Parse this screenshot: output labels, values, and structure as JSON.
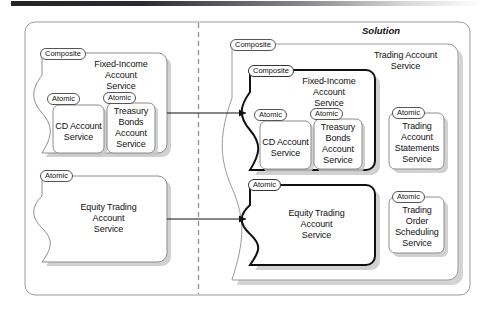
{
  "diagram": {
    "type": "soa-service-composition",
    "top_bar": "header-rule",
    "solution_title": "Solution",
    "divider": "dashed-vertical-separator",
    "left_panel": {
      "name": "before-state-panel",
      "groups": [
        {
          "badge": "Composite",
          "title": "Fixed-Income\nAccount\nService",
          "children": [
            {
              "badge": "Atomic",
              "title": "CD Account\nService"
            },
            {
              "badge": "Atomic",
              "title": "Treasury\nBonds\nAccount\nService"
            }
          ]
        },
        {
          "badge": "Atomic",
          "title": "Equity Trading\nAccount\nService",
          "children": []
        }
      ]
    },
    "right_panel": {
      "name": "solution-state-panel",
      "outer": {
        "badge": "Composite",
        "title": "Trading Account\nService"
      },
      "groups": [
        {
          "badge": "Composite",
          "title": "Fixed-Income\nAccount\nService",
          "emphasis": "bold",
          "children": [
            {
              "badge": "Atomic",
              "title": "CD Account\nService"
            },
            {
              "badge": "Atomic",
              "title": "Treasury\nBonds\nAccount\nService"
            }
          ]
        },
        {
          "badge": "Atomic",
          "title": "Equity Trading\nAccount\nService",
          "emphasis": "bold",
          "children": []
        },
        {
          "badge": "Atomic",
          "title": "Trading\nAccount\nStatements\nService",
          "emphasis": "normal",
          "children": []
        },
        {
          "badge": "Atomic",
          "title": "Trading\nOrder\nScheduling\nService",
          "emphasis": "normal",
          "children": []
        }
      ]
    },
    "arrows": [
      {
        "name": "arrow-fixed-income-migration"
      },
      {
        "name": "arrow-equity-trading-migration"
      }
    ],
    "colors": {
      "stroke": "#8c8c8c",
      "stroke_bold": "#111111",
      "shadow": "#bdbdbd",
      "text": "#111111",
      "background": "#ffffff"
    }
  }
}
